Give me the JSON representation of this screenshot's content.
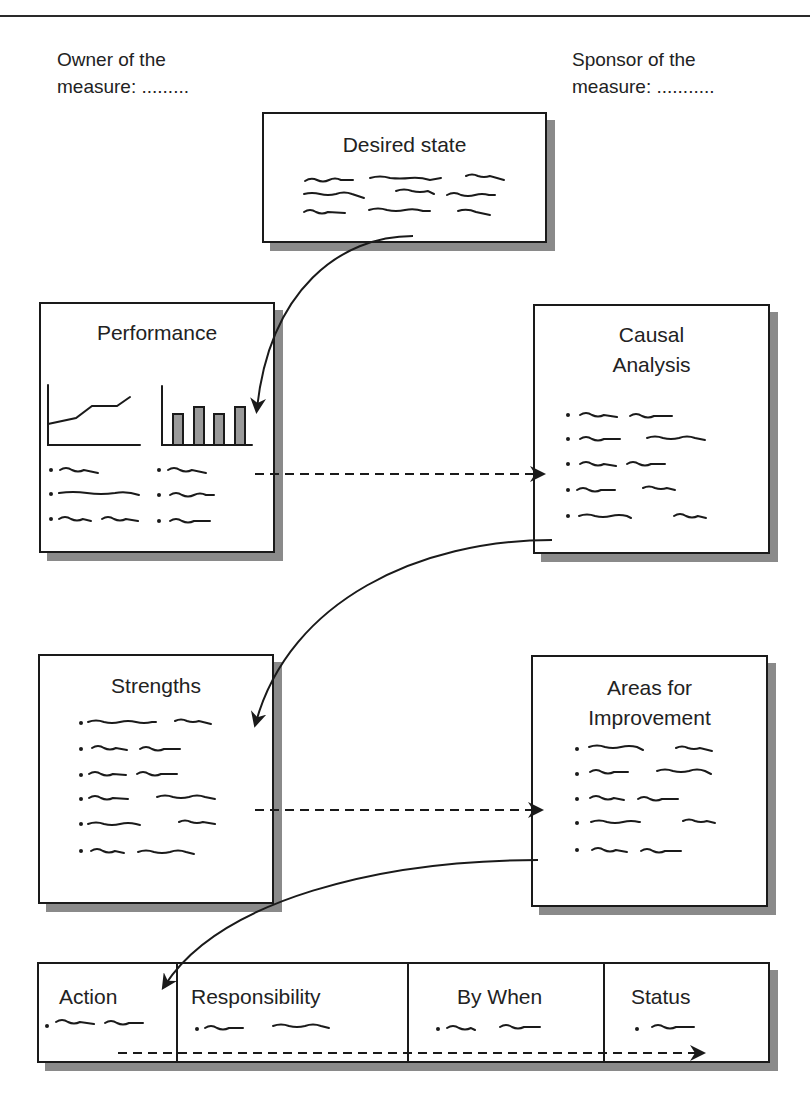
{
  "header": {
    "owner_label": "Owner of the\nmeasure: .........",
    "sponsor_label": "Sponsor of the\nmeasure: ..........."
  },
  "boxes": {
    "desired_state": {
      "title": "Desired state",
      "placeholder_lines": 3
    },
    "performance": {
      "title": "Performance",
      "bullet_count": 6
    },
    "causal_analysis": {
      "title": "Causal\nAnalysis",
      "bullet_count": 5
    },
    "strengths": {
      "title": "Strengths",
      "bullet_count": 6
    },
    "areas_for_improvement": {
      "title": "Areas for\nImprovement",
      "bullet_count": 5
    }
  },
  "action_table": {
    "columns": [
      {
        "label": "Action"
      },
      {
        "label": "Responsibility"
      },
      {
        "label": "By When"
      },
      {
        "label": "Status"
      }
    ]
  },
  "colors": {
    "stroke": "#1a1a1a",
    "shadow": "#8a8a8a",
    "bar_fill": "#9a9a9a",
    "background": "#ffffff"
  },
  "connectors": [
    {
      "from": "desired_state",
      "to": "performance",
      "style": "solid-curve"
    },
    {
      "from": "performance",
      "to": "causal_analysis",
      "style": "dashed"
    },
    {
      "from": "causal_analysis",
      "to": "strengths",
      "style": "solid-curve"
    },
    {
      "from": "strengths",
      "to": "areas_for_improvement",
      "style": "dashed"
    },
    {
      "from": "areas_for_improvement",
      "to": "action_table",
      "style": "solid-curve"
    },
    {
      "from": "action",
      "to": "status",
      "style": "dashed"
    }
  ],
  "mini_charts": {
    "line": {
      "type": "line",
      "x": [
        1,
        2,
        3,
        4,
        5
      ],
      "values": [
        21,
        27,
        39,
        39,
        48
      ]
    },
    "bar": {
      "type": "bar",
      "categories": [
        "1",
        "2",
        "3",
        "4"
      ],
      "values": [
        31,
        38,
        31,
        38
      ]
    }
  }
}
